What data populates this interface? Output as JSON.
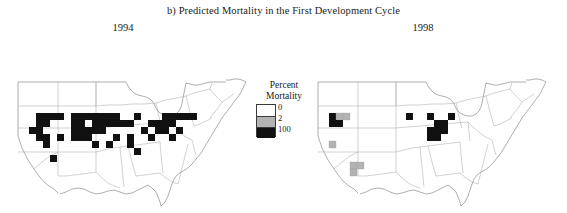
{
  "figure": {
    "panel_title": "b)  Predicted Mortality in the First Development Cycle"
  },
  "maps": [
    {
      "id": "map-1994",
      "year_label": "1994"
    },
    {
      "id": "map-1998",
      "year_label": "1998"
    }
  ],
  "legend": {
    "title_line1": "Percent",
    "title_line2": "Mortality",
    "entries": [
      {
        "label": "0",
        "color": "#ffffff"
      },
      {
        "label": "2",
        "color": "#b3b3b3"
      },
      {
        "label": "100",
        "color": "#111111"
      }
    ]
  },
  "chart_data": {
    "type": "heatmap",
    "title": "b)  Predicted Mortality in the First Development Cycle",
    "xlabel": "",
    "ylabel": "",
    "legend_position": "center",
    "grid": false,
    "colorbar": {
      "title": "Percent Mortality",
      "ticks": [
        0,
        2,
        100
      ],
      "colors": [
        "#ffffff",
        "#b3b3b3",
        "#111111"
      ]
    },
    "cell_size_px": 7,
    "note": "Grid cells over an eastern-US basemap; cell positions are given in map-local pixel coordinates (x,y of cell top-left within the 248x172 map frame), v is Percent Mortality.",
    "series": [
      {
        "name": "1994",
        "cells": [
          {
            "x": 28,
            "y": 77,
            "v": 100
          },
          {
            "x": 35,
            "y": 77,
            "v": 100
          },
          {
            "x": 42,
            "y": 77,
            "v": 100
          },
          {
            "x": 49,
            "y": 77,
            "v": 100
          },
          {
            "x": 28,
            "y": 84,
            "v": 100
          },
          {
            "x": 35,
            "y": 84,
            "v": 100
          },
          {
            "x": 28,
            "y": 91,
            "v": 100
          },
          {
            "x": 21,
            "y": 91,
            "v": 100
          },
          {
            "x": 28,
            "y": 98,
            "v": 100
          },
          {
            "x": 35,
            "y": 98,
            "v": 100
          },
          {
            "x": 49,
            "y": 98,
            "v": 100
          },
          {
            "x": 35,
            "y": 105,
            "v": 100
          },
          {
            "x": 42,
            "y": 119,
            "v": 100
          },
          {
            "x": 70,
            "y": 98,
            "v": 100
          },
          {
            "x": 77,
            "y": 98,
            "v": 100
          },
          {
            "x": 84,
            "y": 105,
            "v": 100
          },
          {
            "x": 63,
            "y": 77,
            "v": 100
          },
          {
            "x": 70,
            "y": 77,
            "v": 100
          },
          {
            "x": 77,
            "y": 77,
            "v": 100
          },
          {
            "x": 84,
            "y": 77,
            "v": 100
          },
          {
            "x": 91,
            "y": 77,
            "v": 100
          },
          {
            "x": 98,
            "y": 77,
            "v": 100
          },
          {
            "x": 105,
            "y": 77,
            "v": 100
          },
          {
            "x": 63,
            "y": 84,
            "v": 100
          },
          {
            "x": 70,
            "y": 84,
            "v": 100
          },
          {
            "x": 84,
            "y": 84,
            "v": 100
          },
          {
            "x": 91,
            "y": 84,
            "v": 100
          },
          {
            "x": 98,
            "y": 84,
            "v": 100
          },
          {
            "x": 105,
            "y": 84,
            "v": 100
          },
          {
            "x": 63,
            "y": 91,
            "v": 100
          },
          {
            "x": 70,
            "y": 91,
            "v": 100
          },
          {
            "x": 77,
            "y": 91,
            "v": 100
          },
          {
            "x": 84,
            "y": 91,
            "v": 100
          },
          {
            "x": 91,
            "y": 91,
            "v": 100
          },
          {
            "x": 63,
            "y": 98,
            "v": 100
          },
          {
            "x": 112,
            "y": 84,
            "v": 100
          },
          {
            "x": 119,
            "y": 84,
            "v": 100
          },
          {
            "x": 126,
            "y": 77,
            "v": 100
          },
          {
            "x": 133,
            "y": 91,
            "v": 100
          },
          {
            "x": 119,
            "y": 98,
            "v": 100
          },
          {
            "x": 119,
            "y": 105,
            "v": 100
          },
          {
            "x": 126,
            "y": 112,
            "v": 100
          },
          {
            "x": 140,
            "y": 84,
            "v": 100
          },
          {
            "x": 147,
            "y": 84,
            "v": 100
          },
          {
            "x": 154,
            "y": 84,
            "v": 100
          },
          {
            "x": 147,
            "y": 91,
            "v": 100
          },
          {
            "x": 154,
            "y": 91,
            "v": 100
          },
          {
            "x": 140,
            "y": 98,
            "v": 100
          },
          {
            "x": 154,
            "y": 77,
            "v": 100
          },
          {
            "x": 161,
            "y": 77,
            "v": 100
          },
          {
            "x": 168,
            "y": 77,
            "v": 100
          },
          {
            "x": 161,
            "y": 84,
            "v": 100
          },
          {
            "x": 168,
            "y": 91,
            "v": 100
          },
          {
            "x": 175,
            "y": 77,
            "v": 100
          },
          {
            "x": 182,
            "y": 77,
            "v": 100
          },
          {
            "x": 161,
            "y": 98,
            "v": 100
          },
          {
            "x": 105,
            "y": 98,
            "v": 100
          },
          {
            "x": 98,
            "y": 105,
            "v": 100
          }
        ]
      },
      {
        "name": "1998",
        "cells": [
          {
            "x": 21,
            "y": 77,
            "v": 100
          },
          {
            "x": 28,
            "y": 77,
            "v": 2
          },
          {
            "x": 35,
            "y": 77,
            "v": 2
          },
          {
            "x": 21,
            "y": 84,
            "v": 100
          },
          {
            "x": 28,
            "y": 84,
            "v": 100
          },
          {
            "x": 21,
            "y": 105,
            "v": 2
          },
          {
            "x": 42,
            "y": 126,
            "v": 2
          },
          {
            "x": 49,
            "y": 126,
            "v": 2
          },
          {
            "x": 42,
            "y": 133,
            "v": 2
          },
          {
            "x": 98,
            "y": 77,
            "v": 100
          },
          {
            "x": 119,
            "y": 77,
            "v": 100
          },
          {
            "x": 140,
            "y": 77,
            "v": 100
          },
          {
            "x": 126,
            "y": 84,
            "v": 100
          },
          {
            "x": 133,
            "y": 84,
            "v": 100
          },
          {
            "x": 119,
            "y": 91,
            "v": 100
          },
          {
            "x": 126,
            "y": 91,
            "v": 100
          },
          {
            "x": 133,
            "y": 91,
            "v": 100
          },
          {
            "x": 119,
            "y": 98,
            "v": 100
          },
          {
            "x": 126,
            "y": 98,
            "v": 100
          }
        ]
      }
    ]
  }
}
